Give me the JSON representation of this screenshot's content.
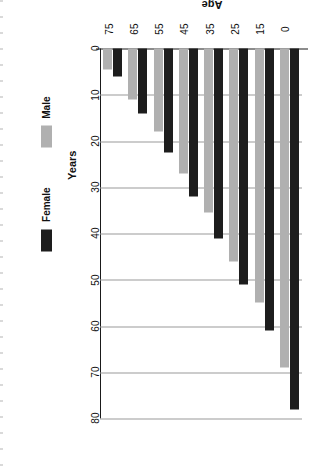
{
  "chart_data": {
    "type": "bar",
    "title": "",
    "xlabel": "Age",
    "ylabel": "Years",
    "categories": [
      "0",
      "15",
      "25",
      "35",
      "45",
      "55",
      "65",
      "75"
    ],
    "series": [
      {
        "name": "Female",
        "color": "#1d1d1d",
        "values": [
          78,
          61,
          51,
          41,
          32,
          22.5,
          14,
          6
        ]
      },
      {
        "name": "Male",
        "color": "#b0b0b0",
        "values": [
          69,
          55,
          46,
          35.5,
          27,
          18,
          11,
          4.5
        ]
      }
    ],
    "ylim": [
      0,
      80
    ],
    "yticks": [
      "0",
      "10",
      "20",
      "30",
      "40",
      "50",
      "60",
      "70",
      "80"
    ],
    "ytick_values": [
      0,
      10,
      20,
      30,
      40,
      50,
      60,
      70,
      80
    ],
    "grid": true,
    "orientation": "horizontal",
    "rotated_page": true,
    "legend_position": "bottom",
    "legend": [
      "Female",
      "Male"
    ]
  },
  "axes": {
    "y_title": "Years",
    "x_title": "Age"
  },
  "legend": {
    "items": [
      {
        "label": "Female",
        "color": "#1d1d1d"
      },
      {
        "label": "Male",
        "color": "#b0b0b0"
      }
    ]
  }
}
